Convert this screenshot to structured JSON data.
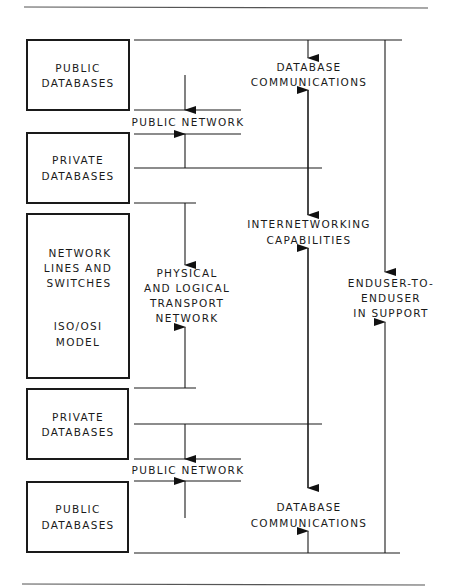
{
  "diagram": {
    "boxes": [
      {
        "id": "public-databases-top",
        "lines": [
          "PUBLIC",
          "DATABASES"
        ]
      },
      {
        "id": "private-databases-top",
        "lines": [
          "PRIVATE",
          "DATABASES"
        ]
      },
      {
        "id": "network-lines",
        "lines": [
          "NETWORK",
          "LINES AND",
          "SWITCHES",
          "ISO/OSI",
          "MODEL"
        ]
      },
      {
        "id": "private-databases-bottom",
        "lines": [
          "PRIVATE",
          "DATABASES"
        ]
      },
      {
        "id": "public-databases-bottom",
        "lines": [
          "PUBLIC",
          "DATABASES"
        ]
      }
    ],
    "labels": {
      "public_network_top": "PUBLIC NETWORK",
      "public_network_bottom": "PUBLIC NETWORK",
      "transport": [
        "PHYSICAL",
        "AND LOGICAL",
        "TRANSPORT",
        "NETWORK"
      ],
      "db_comm_top": [
        "DATABASE",
        "COMMUNICATIONS"
      ],
      "internetworking": [
        "INTERNETWORKING",
        "CAPABILITIES"
      ],
      "enduser": [
        "ENDUSER-TO-",
        "ENDUSER",
        "IN SUPPORT"
      ],
      "db_comm_bottom": [
        "DATABASE",
        "COMMUNICATIONS"
      ]
    },
    "colors": {
      "ink": "#1a1a1a",
      "background": "#ffffff",
      "rule": "#555555"
    }
  }
}
